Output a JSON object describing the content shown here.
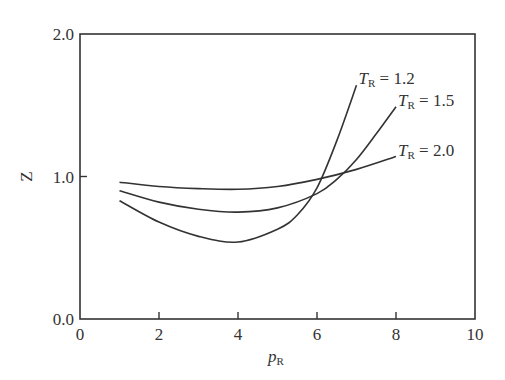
{
  "chart_data": {
    "type": "line",
    "title": "",
    "xlabel": "p_R",
    "xlabel_main": "p",
    "xlabel_sub": "R",
    "ylabel": "Z",
    "xlim": [
      0,
      10
    ],
    "ylim": [
      0.0,
      2.0
    ],
    "xticks": [
      0,
      2,
      4,
      6,
      8,
      10
    ],
    "xtick_labels": [
      "0",
      "2",
      "4",
      "6",
      "8",
      "10"
    ],
    "yticks": [
      0.0,
      1.0,
      2.0
    ],
    "ytick_labels": [
      "0.0",
      "1.0",
      "2.0"
    ],
    "grid": false,
    "legend_position": "inline labels at curve ends",
    "series": [
      {
        "name": "T_R = 1.2",
        "label_main": "T",
        "label_sub": "R",
        "label_value": " = 1.2",
        "x": [
          1.0,
          2.0,
          3.0,
          4.0,
          5.0,
          5.5,
          6.0,
          6.5,
          7.0
        ],
        "y": [
          0.83,
          0.68,
          0.58,
          0.54,
          0.63,
          0.73,
          0.92,
          1.25,
          1.64
        ]
      },
      {
        "name": "T_R = 1.5",
        "label_main": "T",
        "label_sub": "R",
        "label_value": " = 1.5",
        "x": [
          1.0,
          2.0,
          3.0,
          4.0,
          5.0,
          6.0,
          6.5,
          7.0,
          7.5,
          8.0
        ],
        "y": [
          0.9,
          0.82,
          0.77,
          0.75,
          0.78,
          0.88,
          0.98,
          1.12,
          1.3,
          1.49
        ]
      },
      {
        "name": "T_R = 2.0",
        "label_main": "T",
        "label_sub": "R",
        "label_value": " = 2.0",
        "x": [
          1.0,
          2.0,
          3.0,
          4.0,
          5.0,
          6.0,
          7.0,
          8.0
        ],
        "y": [
          0.96,
          0.93,
          0.915,
          0.91,
          0.93,
          0.98,
          1.05,
          1.14
        ]
      }
    ],
    "line_color": "#333333"
  }
}
